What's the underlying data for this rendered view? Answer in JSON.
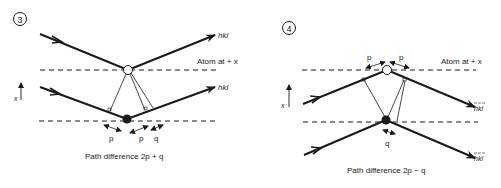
{
  "panels": [
    {
      "number": "3",
      "atom_label": "Atom at + x",
      "ray_out_top_label": "hkl",
      "ray_out_bottom_label": "hkl",
      "axis_label": "x",
      "segment_labels": [
        "p",
        "p",
        "q"
      ],
      "caption": "Path difference 2p + q"
    },
    {
      "number": "4",
      "atom_label": "Atom at + x",
      "ray_out_top_label": "hkl",
      "ray_out_bottom_label": "hkl",
      "axis_label": "x",
      "segment_labels": [
        "p",
        "p",
        "q"
      ],
      "caption": "Path difference 2p − q"
    }
  ],
  "colors": {
    "ink": "#1a1a1a",
    "background": "#ffffff"
  }
}
